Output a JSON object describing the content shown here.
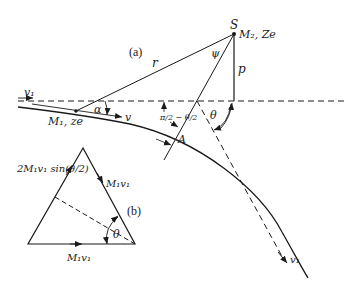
{
  "diagram": {
    "part_a": {
      "label": "(a)",
      "scatterer": {
        "point": "S",
        "label": "M₂, Ze"
      },
      "projectile": {
        "label": "M₁, ze"
      },
      "incoming_velocity": "v₁",
      "current_velocity": "v",
      "outgoing_velocity": "v₁",
      "distance": "r",
      "impact_parameter": "p",
      "angles": {
        "alpha": "α",
        "psi": "ψ",
        "theta": "θ",
        "apsis_angle": "π/2 − θ/2"
      },
      "apsis_point": "A"
    },
    "part_b": {
      "label": "(b)",
      "initial_momentum": "M₁v₁",
      "final_momentum": "M₁v₁",
      "momentum_change": "2M₁v₁ sin(θ/2)",
      "angle": "θ"
    },
    "colors": {
      "ink": "#1a1a1a",
      "background": "#ffffff"
    }
  }
}
